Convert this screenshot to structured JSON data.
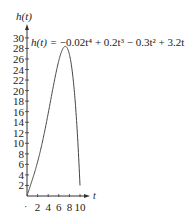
{
  "chart_data": {
    "type": "line",
    "title": "",
    "annotation": "h(t) = −0.02t⁴ + 0.2t³ − 0.3t² + 3.2t",
    "xlabel": "t",
    "ylabel": "h(t)",
    "xlim": [
      0,
      10
    ],
    "ylim": [
      0,
      30
    ],
    "x_ticks": [
      2,
      4,
      6,
      8,
      10
    ],
    "y_ticks": [
      2,
      4,
      6,
      8,
      10,
      12,
      14,
      16,
      18,
      20,
      22,
      24,
      26,
      28,
      30
    ],
    "grid": false,
    "series": [
      {
        "name": "h(t)",
        "x": [
          0,
          1,
          2,
          3,
          4,
          5,
          6,
          7,
          8,
          9,
          10
        ],
        "values": [
          0,
          3.08,
          5.92,
          9.12,
          12.88,
          17.25,
          21.6,
          25.2,
          26.88,
          19.08,
          2
        ]
      }
    ]
  },
  "labels": {
    "ylabel": "h(t)",
    "xlabel": "t",
    "equation_lhs": "h(t) = ",
    "equation_rhs": "−0.02t⁴ + 0.2t³ − 0.3t² + 3.2t",
    "x_origin_mark": "·"
  }
}
